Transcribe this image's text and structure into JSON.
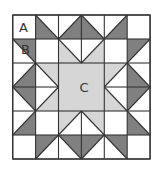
{
  "diagram": {
    "type": "quilt-block",
    "grid": {
      "cols": 6,
      "rows": 6,
      "origin_x": 12.7,
      "origin_y": 15,
      "cell_w": 22.9,
      "cell_h": 24
    },
    "colors": {
      "background": "#ffffff",
      "white": "#ffffff",
      "dark": "#808080",
      "light": "#d6d6d6",
      "line": "#333333"
    },
    "labels": [
      {
        "text": "A",
        "col": 0,
        "row": 0,
        "dx": 0.28,
        "dy": 0.72
      },
      {
        "text": "B",
        "col": 0,
        "row": 1,
        "dx": 0.36,
        "dy": 0.62
      },
      {
        "text": "C",
        "col": 2,
        "row": 2,
        "dx": 0.92,
        "dy": 1.2
      }
    ],
    "pieces": [
      {
        "id": "A-square",
        "shape": "square",
        "col": 0,
        "row": 0,
        "fill": "white"
      },
      {
        "shape": "tri",
        "col": 1,
        "row": 0,
        "corner": "BL",
        "fill": "dark"
      },
      {
        "shape": "tri",
        "col": 2,
        "row": 0,
        "corner": "BR",
        "fill": "dark"
      },
      {
        "shape": "tri",
        "col": 3,
        "row": 0,
        "corner": "BL",
        "fill": "dark"
      },
      {
        "shape": "tri",
        "col": 4,
        "row": 0,
        "corner": "BR",
        "fill": "dark"
      },
      {
        "shape": "square",
        "col": 5,
        "row": 0,
        "fill": "white"
      },
      {
        "shape": "tri",
        "col": 0,
        "row": 1,
        "corner": "TR",
        "fill": "dark"
      },
      {
        "shape": "square",
        "col": 1,
        "row": 1,
        "fill": "white"
      },
      {
        "shape": "tri",
        "col": 2,
        "row": 1,
        "corner": "BL",
        "fill": "light"
      },
      {
        "shape": "tri",
        "col": 3,
        "row": 1,
        "corner": "BR",
        "fill": "light"
      },
      {
        "shape": "square",
        "col": 4,
        "row": 1,
        "fill": "white"
      },
      {
        "shape": "tri",
        "col": 5,
        "row": 1,
        "corner": "TL",
        "fill": "dark"
      },
      {
        "shape": "tri",
        "col": 0,
        "row": 2,
        "corner": "BR",
        "fill": "dark"
      },
      {
        "shape": "tri",
        "col": 1,
        "row": 2,
        "corner": "TR",
        "fill": "light"
      },
      {
        "id": "C-center",
        "shape": "rect",
        "col": 2,
        "row": 2,
        "w": 2,
        "h": 2,
        "fill": "light"
      },
      {
        "shape": "tri",
        "col": 4,
        "row": 2,
        "corner": "TL",
        "fill": "light"
      },
      {
        "shape": "tri",
        "col": 5,
        "row": 2,
        "corner": "BL",
        "fill": "dark"
      },
      {
        "shape": "tri",
        "col": 0,
        "row": 3,
        "corner": "TR",
        "fill": "dark"
      },
      {
        "shape": "tri",
        "col": 1,
        "row": 3,
        "corner": "BR",
        "fill": "light"
      },
      {
        "shape": "tri",
        "col": 4,
        "row": 3,
        "corner": "BL",
        "fill": "light"
      },
      {
        "shape": "tri",
        "col": 5,
        "row": 3,
        "corner": "TL",
        "fill": "dark"
      },
      {
        "shape": "tri",
        "col": 0,
        "row": 4,
        "corner": "BR",
        "fill": "dark"
      },
      {
        "shape": "square",
        "col": 1,
        "row": 4,
        "fill": "white"
      },
      {
        "shape": "tri",
        "col": 2,
        "row": 4,
        "corner": "TL",
        "fill": "light"
      },
      {
        "shape": "tri",
        "col": 3,
        "row": 4,
        "corner": "TR",
        "fill": "light"
      },
      {
        "shape": "square",
        "col": 4,
        "row": 4,
        "fill": "white"
      },
      {
        "shape": "tri",
        "col": 5,
        "row": 4,
        "corner": "BL",
        "fill": "dark"
      },
      {
        "shape": "square",
        "col": 0,
        "row": 5,
        "fill": "white"
      },
      {
        "shape": "tri",
        "col": 1,
        "row": 5,
        "corner": "TL",
        "fill": "dark"
      },
      {
        "shape": "tri",
        "col": 2,
        "row": 5,
        "corner": "TR",
        "fill": "dark"
      },
      {
        "shape": "tri",
        "col": 3,
        "row": 5,
        "corner": "TL",
        "fill": "dark"
      },
      {
        "shape": "tri",
        "col": 4,
        "row": 5,
        "corner": "TR",
        "fill": "dark"
      },
      {
        "shape": "square",
        "col": 5,
        "row": 5,
        "fill": "white"
      }
    ]
  }
}
